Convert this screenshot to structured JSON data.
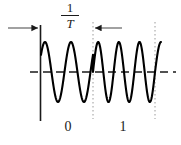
{
  "figure": {
    "title": "",
    "labels": {
      "period_numerator": "1",
      "period_denominator": "T",
      "bit_0": "0",
      "bit_1": "1"
    },
    "colors": {
      "ink": "#1a1a1a",
      "waveform": "#000000",
      "guide": "#9a9a9a",
      "background": "#ffffff"
    }
  },
  "chart_data": {
    "type": "line",
    "title": "",
    "subtitle": "",
    "xlabel": "",
    "ylabel": "",
    "legend_position": "none",
    "grid": false,
    "annotations": [
      {
        "name": "period-fraction",
        "text": "1/T",
        "x": 70,
        "y": 16
      },
      {
        "name": "bit-symbol-0",
        "text": "0",
        "x": 68,
        "y": 127
      },
      {
        "name": "bit-symbol-1",
        "text": "1",
        "x": 123,
        "y": 127
      }
    ],
    "axes": {
      "vertical_axis_x": 40,
      "zero_line_y": 72,
      "zero_line_x_start": 41,
      "zero_line_x_end": 176,
      "vertical_axis_y_top": 25,
      "vertical_axis_y_bottom": 121
    },
    "guides": [
      {
        "name": "bit-boundary-left",
        "x": 93,
        "y_top": 22,
        "y_bottom": 119
      },
      {
        "name": "bit-boundary-right",
        "x": 155,
        "y_top": 22,
        "y_bottom": 119
      }
    ],
    "measure_arrows": [
      {
        "name": "arrow-left",
        "x_from": 8,
        "x_to": 40,
        "y": 28,
        "direction": "right"
      },
      {
        "name": "arrow-right",
        "x_from": 122,
        "x_to": 93,
        "y": 28,
        "direction": "left"
      }
    ],
    "series": [
      {
        "name": "fsk-waveform-bit-0",
        "cycles": 2,
        "amplitude": 30,
        "x_start": 41,
        "x_end": 93,
        "baseline_y": 72,
        "phase_start_deg": 35
      },
      {
        "name": "fsk-waveform-bit-1",
        "cycles": 3,
        "amplitude": 30,
        "x_start": 93,
        "x_end": 155,
        "baseline_y": 72,
        "phase_start_deg": 0
      },
      {
        "name": "fsk-waveform-tail",
        "cycles": 0.25,
        "amplitude": 30,
        "x_start": 155,
        "x_end": 161,
        "baseline_y": 72,
        "phase_start_deg": 0
      }
    ]
  }
}
